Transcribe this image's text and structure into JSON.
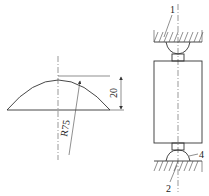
{
  "figure": {
    "left": {
      "title": "Spherical seat profile",
      "dimension_height": "20",
      "radius_label": "R75"
    },
    "right": {
      "title": "Compression test fixture",
      "callouts": [
        {
          "id": "1",
          "label": "1"
        },
        {
          "id": "2",
          "label": "2"
        },
        {
          "id": "4",
          "label": "4"
        }
      ]
    }
  }
}
